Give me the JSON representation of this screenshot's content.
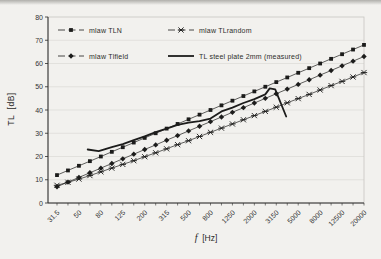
{
  "figure": {
    "background": "#f2f1ee"
  },
  "chart_data": {
    "type": "line",
    "title": "",
    "xlabel": "f [Hz]",
    "xlabel_symbol": "f",
    "xlabel_unit": "  [Hz]",
    "ylabel": "TL [dB]",
    "ylabel_display": "TL  [dB]",
    "ylim": [
      0,
      80
    ],
    "ytick_step": 10,
    "y_tick_labels": [
      "0",
      "10",
      "20",
      "30",
      "40",
      "50",
      "60",
      "70",
      "80"
    ],
    "x_band_frequencies": [
      31.5,
      40,
      50,
      63,
      80,
      100,
      125,
      160,
      200,
      250,
      315,
      400,
      500,
      630,
      800,
      1000,
      1250,
      1600,
      2000,
      2500,
      3150,
      4000,
      5000,
      6300,
      8000,
      10000,
      12500,
      16000,
      20000
    ],
    "x_tick_labels": [
      "31.5",
      "50",
      "80",
      "125",
      "200",
      "315",
      "500",
      "800",
      "1250",
      "2000",
      "3150",
      "5000",
      "8000",
      "12500",
      "20000"
    ],
    "grid": "faint horizontal gridlines every 10 dB",
    "legend_position": "top-left inside plot, two columns",
    "axis_color": "#2b2b2a",
    "series_color": "#1c1c1b",
    "grid_color": "#dbdad5",
    "border_color": "#c7c6c1",
    "series": [
      {
        "name": "mlaw TLN",
        "marker": "square",
        "line_style": "thin",
        "values": [
          12,
          14,
          16,
          18,
          20,
          22,
          24,
          26,
          28,
          30,
          32,
          34,
          36,
          38,
          40,
          42,
          44,
          46,
          48,
          50,
          52,
          54,
          56,
          58,
          60,
          62,
          64,
          66,
          68
        ]
      },
      {
        "name": "mlaw TLrandom",
        "marker": "asterisk",
        "line_style": "thin",
        "values": [
          7.6,
          8.9,
          10.3,
          11.8,
          13.4,
          15.0,
          16.6,
          18.2,
          19.9,
          21.6,
          23.3,
          25.1,
          26.8,
          28.6,
          30.4,
          32.2,
          34.0,
          35.8,
          37.6,
          39.4,
          41.2,
          43.1,
          44.9,
          46.7,
          48.6,
          50.5,
          52.3,
          54.2,
          56.1
        ]
      },
      {
        "name": "mlaw Tlfield",
        "marker": "diamond",
        "line_style": "thin",
        "values": [
          7,
          9,
          11,
          13,
          15,
          17,
          19,
          21,
          23,
          25,
          27,
          29,
          31,
          33,
          35,
          37,
          39,
          41,
          43,
          45,
          47,
          49,
          51,
          53,
          55,
          57,
          59,
          61,
          63
        ]
      },
      {
        "name": "TL steel plate 2mm (measured)",
        "marker": "none",
        "line_style": "thick",
        "points": [
          [
            2.8,
            23.0
          ],
          [
            3.8,
            22.3
          ],
          [
            5,
            24.0
          ],
          [
            6,
            25.3
          ],
          [
            7,
            27.0
          ],
          [
            8,
            28.7
          ],
          [
            9,
            30.5
          ],
          [
            10,
            32.0
          ],
          [
            11,
            33.6
          ],
          [
            12,
            34.6
          ],
          [
            13,
            35.2
          ],
          [
            14,
            36.3
          ],
          [
            15,
            39.4
          ],
          [
            16,
            41.0
          ],
          [
            17,
            43.0
          ],
          [
            18,
            44.7
          ],
          [
            19,
            46.7
          ],
          [
            19.4,
            49.3
          ],
          [
            19.9,
            48.9
          ],
          [
            20.9,
            37.2
          ]
        ]
      }
    ]
  }
}
